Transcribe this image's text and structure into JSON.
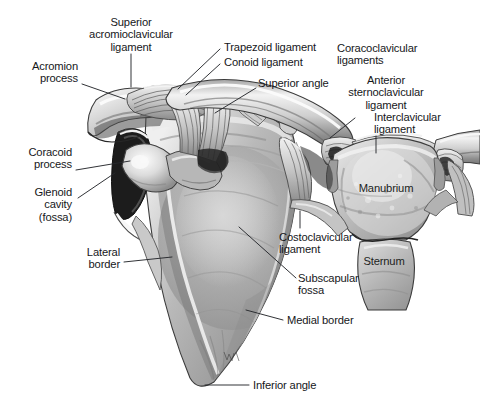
{
  "figure": {
    "artist_signature": "CW",
    "background_color": "#ffffff",
    "ink_color": "#16171a",
    "leader_line_color": "#26282c"
  },
  "labels": [
    {
      "id": "superior-acromioclavicular-ligament",
      "text": "Superior\nacromioclavicular\nligament",
      "align": "center",
      "x": 131,
      "y": 16,
      "leader": [
        [
          131,
          54
        ],
        [
          131,
          87
        ]
      ]
    },
    {
      "id": "acromion-process",
      "text": "Acromion\nprocess",
      "align": "right",
      "x": 78,
      "y": 60,
      "leader": [
        [
          82,
          84
        ],
        [
          125,
          99
        ]
      ]
    },
    {
      "id": "coracoid-process",
      "text": "Coracoid\nprocess",
      "align": "right",
      "x": 72,
      "y": 146,
      "leader": [
        [
          76,
          170
        ],
        [
          130,
          161
        ]
      ]
    },
    {
      "id": "glenoid-cavity-fossa",
      "text": "Glenoid\ncavity\n(fossa)",
      "align": "right",
      "x": 72,
      "y": 186,
      "leader": [
        [
          78,
          198
        ],
        [
          115,
          173
        ]
      ]
    },
    {
      "id": "lateral-border",
      "text": "Lateral\nborder",
      "align": "right",
      "x": 120,
      "y": 246,
      "leader": [
        [
          124,
          262
        ],
        [
          172,
          257
        ]
      ]
    },
    {
      "id": "trapezoid-ligament",
      "text": "Trapezoid ligament",
      "align": "left",
      "x": 224,
      "y": 41,
      "leader": [
        [
          220,
          49
        ],
        [
          178,
          89
        ]
      ]
    },
    {
      "id": "conoid-ligament",
      "text": "Conoid ligament",
      "align": "left",
      "x": 224,
      "y": 56,
      "leader": [
        [
          220,
          64
        ],
        [
          186,
          95
        ]
      ]
    },
    {
      "id": "coracoclavicular-ligaments",
      "text": "Coracoclavicular\nligaments",
      "align": "left",
      "x": 337,
      "y": 42,
      "bracket": {
        "x": 318,
        "y1": 45,
        "y2": 70,
        "tick_x": 327
      }
    },
    {
      "id": "superior-angle",
      "text": "Superior angle",
      "align": "left",
      "x": 258,
      "y": 77,
      "leader": [
        [
          256,
          88
        ],
        [
          215,
          113
        ]
      ]
    },
    {
      "id": "anterior-sternoclavicular-ligament",
      "text": "Anterior\nsternoclavicular\nligament",
      "align": "center",
      "x": 386,
      "y": 74,
      "leader": [
        [
          355,
          118
        ],
        [
          330,
          138
        ]
      ]
    },
    {
      "id": "interclavicular-ligament",
      "text": "Interclavicular\nligament",
      "align": "left",
      "x": 374,
      "y": 111,
      "leader": [
        [
          376,
          136
        ],
        [
          376,
          153
        ]
      ]
    },
    {
      "id": "costoclavicular-ligament",
      "text": "Costoclavicular\nligament",
      "align": "left",
      "x": 279,
      "y": 231,
      "leader": [
        [
          300,
          211
        ],
        [
          300,
          228
        ]
      ]
    },
    {
      "id": "subscapular-fossa",
      "text": "Subscapular\nfossa",
      "align": "left",
      "x": 298,
      "y": 272,
      "leader": [
        [
          296,
          278
        ],
        [
          239,
          227
        ]
      ]
    },
    {
      "id": "medial-border",
      "text": "Medial border",
      "align": "left",
      "x": 287,
      "y": 314,
      "leader": [
        [
          283,
          320
        ],
        [
          246,
          310
        ]
      ]
    },
    {
      "id": "inferior-angle",
      "text": "Inferior angle",
      "align": "left",
      "x": 253,
      "y": 379,
      "leader": [
        [
          249,
          385
        ],
        [
          205,
          385
        ]
      ]
    },
    {
      "id": "manubrium",
      "text": "Manubrium",
      "align": "center",
      "x": 386,
      "y": 182,
      "on_art": true
    },
    {
      "id": "sternum",
      "text": "Sternum",
      "align": "center",
      "x": 384,
      "y": 255,
      "on_art": true
    }
  ]
}
